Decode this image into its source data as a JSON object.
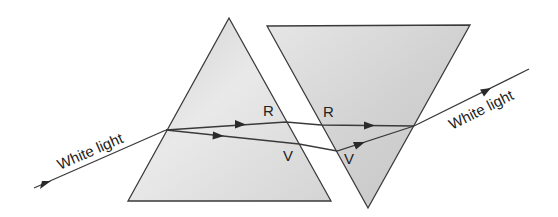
{
  "diagram": {
    "colors": {
      "background": "#ffffff",
      "prism_fill_light": "#ececec",
      "prism_fill_dark": "#c9c9c9",
      "line": "#3a3a3a"
    },
    "prisms": [
      {
        "name": "first-prism",
        "orientation": "upright",
        "vertices": [
          [
            229,
            18
          ],
          [
            128,
            201
          ],
          [
            331,
            201
          ]
        ]
      },
      {
        "name": "second-prism",
        "orientation": "inverted",
        "vertices": [
          [
            267,
            26
          ],
          [
            470,
            25
          ],
          [
            368,
            208
          ]
        ]
      }
    ],
    "labels": {
      "incident": "White light",
      "emergent": "White light",
      "red_first": "R",
      "red_second": "R",
      "violet_first": "V",
      "violet_second": "V"
    },
    "rays": {
      "incident": [
        [
          34,
          188
        ],
        [
          166,
          130
        ]
      ],
      "red": [
        [
          166,
          130
        ],
        [
          286,
          122
        ],
        [
          321,
          125
        ],
        [
          414,
          126
        ]
      ],
      "violet": [
        [
          166,
          130
        ],
        [
          299,
          144
        ],
        [
          337,
          151
        ],
        [
          414,
          126
        ]
      ],
      "emergent": [
        [
          414,
          126
        ],
        [
          529,
          69
        ]
      ]
    }
  }
}
